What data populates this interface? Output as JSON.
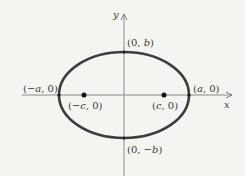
{
  "diagram": {
    "axes": {
      "x_label": "x",
      "y_label": "y"
    },
    "labels": {
      "top_vertex": [
        "(0, ",
        "b",
        ")"
      ],
      "bottom_vertex": [
        "(0, −",
        "b",
        ")"
      ],
      "left_vertex": [
        "(−",
        "a",
        ", 0)"
      ],
      "right_vertex": [
        "(",
        "a",
        ", 0)"
      ],
      "left_focus": [
        "(−",
        "c",
        ", 0)"
      ],
      "right_focus": [
        "(",
        "c",
        ", 0)"
      ]
    },
    "colors": {
      "ellipse": "#3d3d3d",
      "axis": "#7a7a7a",
      "background": "#f4f4f1"
    }
  }
}
